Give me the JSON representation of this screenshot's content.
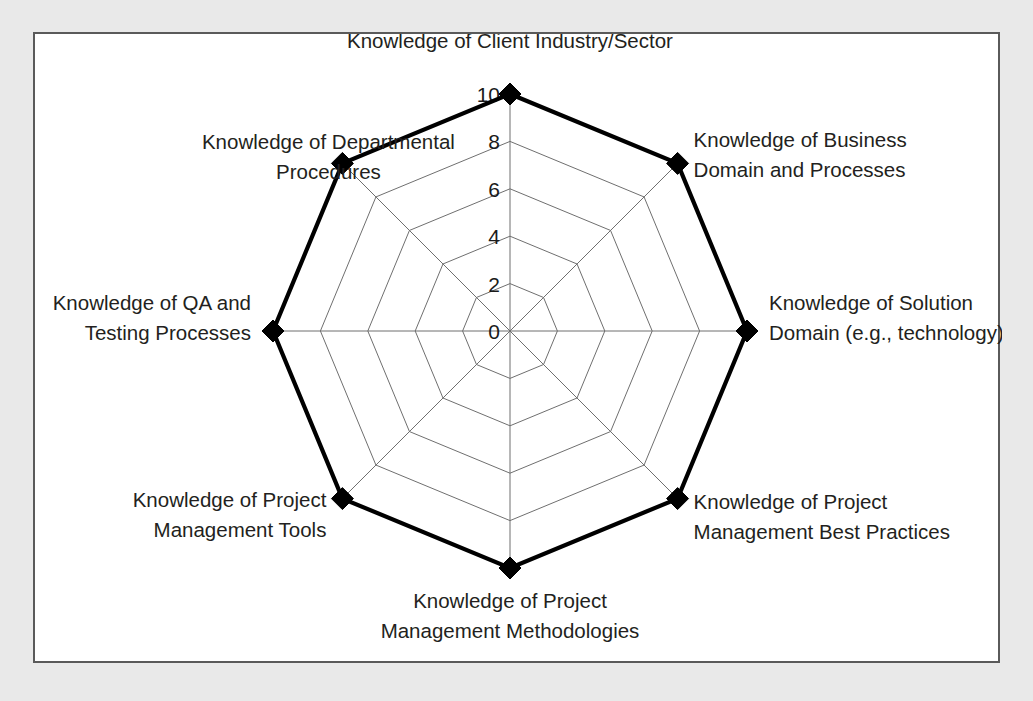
{
  "figure": {
    "background_color": "#e9e9e9",
    "panel_color": "#ffffff",
    "border_color": "#5a5a5a"
  },
  "chart_data": {
    "type": "radar",
    "title": "",
    "xlabel": "",
    "ylabel": "",
    "categories": [
      "Knowledge of Client Industry/Sector",
      "Knowledge of Business Domain and Processes",
      "Knowledge of Solution Domain (e.g., technology)",
      "Knowledge of Project Management Best Practices",
      "Knowledge of Project Management Methodologies",
      "Knowledge of Project Management Tools",
      "Knowledge of QA and Testing Processes",
      "Knowledge of Departmental Procedures"
    ],
    "category_lines": [
      [
        "Knowledge of Client Industry/Sector"
      ],
      [
        "Knowledge of Business",
        "Domain and Processes"
      ],
      [
        "Knowledge of Solution",
        "Domain (e.g., technology)"
      ],
      [
        "Knowledge of Project",
        "Management Best Practices"
      ],
      [
        "Knowledge of Project",
        "Management Methodologies"
      ],
      [
        "Knowledge of Project",
        "Management Tools"
      ],
      [
        "Knowledge of QA and",
        "Testing Processes"
      ],
      [
        "Knowledge of Departmental",
        "Procedures"
      ]
    ],
    "values": [
      10,
      10,
      10,
      10,
      10,
      10,
      10,
      10
    ],
    "tick_labels": [
      "0",
      "2",
      "4",
      "6",
      "8",
      "10"
    ],
    "tick_values": [
      0,
      2,
      4,
      6,
      8,
      10
    ],
    "rlim": [
      0,
      10
    ],
    "grid": true,
    "legend": "none",
    "series": [
      {
        "name": "Knowledge",
        "values": [
          10,
          10,
          10,
          10,
          10,
          10,
          10,
          10
        ],
        "line_color": "#000000",
        "marker": "diamond"
      }
    ]
  }
}
